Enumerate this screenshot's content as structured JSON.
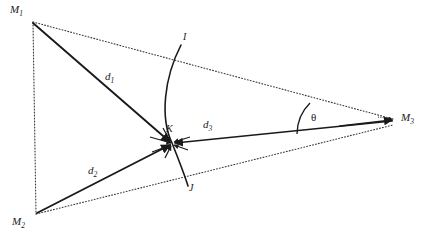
{
  "figure": {
    "background_color": "#ffffff",
    "stroke_color": "#1a1a1a",
    "dotted_color": "#3a3a3a",
    "width": 422,
    "height": 238
  },
  "vertices": [
    {
      "id": "M1",
      "label": "M",
      "subscript": "1",
      "x": 33,
      "y": 22,
      "label_x": 10,
      "label_y": 4
    },
    {
      "id": "M2",
      "label": "M",
      "subscript": "2",
      "x": 36,
      "y": 214,
      "label_x": 12,
      "label_y": 216
    },
    {
      "id": "M3",
      "label": "M",
      "subscript": "3",
      "x": 394,
      "y": 119,
      "label_x": 401,
      "label_y": 112
    }
  ],
  "intersection_point": {
    "id": "K",
    "label": "K",
    "x": 172,
    "y": 143,
    "label_x": 166,
    "label_y": 124
  },
  "arc_endpoints": [
    {
      "id": "I",
      "label": "I",
      "x": 181,
      "y": 45,
      "label_x": 183,
      "label_y": 32
    },
    {
      "id": "J",
      "label": "J",
      "x": 187,
      "y": 186,
      "label_x": 189,
      "label_y": 183
    }
  ],
  "distances": [
    {
      "id": "d1",
      "label": "d",
      "subscript": "1",
      "from": "M1",
      "to": "K",
      "label_x": 105,
      "label_y": 71,
      "style": "solid-arrow"
    },
    {
      "id": "d2",
      "label": "d",
      "subscript": "2",
      "from": "M2",
      "to": "K",
      "label_x": 88,
      "label_y": 165,
      "style": "solid-arrow"
    },
    {
      "id": "d3",
      "label": "d",
      "subscript": "3",
      "from": "M3",
      "to": "K",
      "label_x": 203,
      "label_y": 119,
      "style": "solid-arrow"
    }
  ],
  "angle": {
    "id": "theta",
    "label": "θ",
    "vertex": "M3",
    "label_x": 311,
    "label_y": 112,
    "between": [
      "M3-M1 baseline",
      "d3 vector"
    ]
  },
  "edges": [
    {
      "id": "M1-M2",
      "style": "dotted",
      "from": "M1",
      "to": "M2"
    },
    {
      "id": "M1-M3",
      "style": "dotted",
      "from": "M1",
      "to": "M3"
    },
    {
      "id": "M2-M3",
      "style": "dotted",
      "from": "M2",
      "to": "M3"
    }
  ],
  "arc": {
    "id": "arc-IJ",
    "description": "circular arc through K from I to J",
    "style": "solid"
  }
}
